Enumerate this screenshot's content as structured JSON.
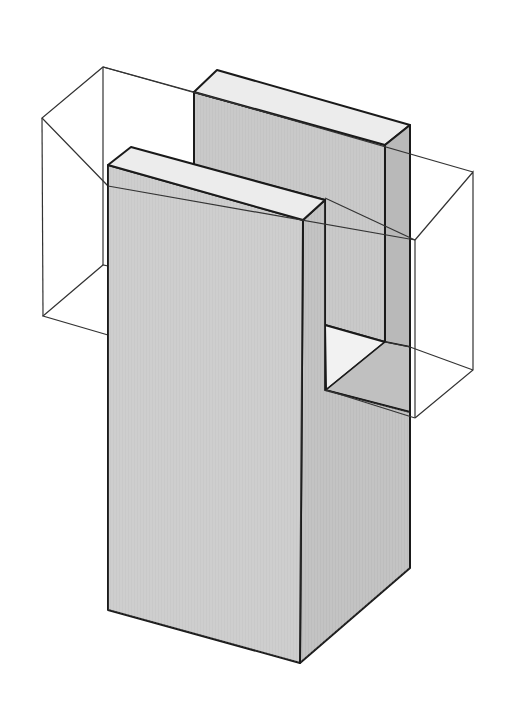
{
  "figure": {
    "title": "Isometric view of a U-shaped block with wireframe cross bar",
    "colors": {
      "background": "#ffffff",
      "face_front": "#c9c9c9",
      "face_side": "#bdbdbd",
      "face_top": "#ececec",
      "face_inner": "#b8b8b8",
      "notch_floor": "#f2f2f2",
      "outline": "#1a1a1a",
      "wireframe": "#333333"
    }
  }
}
